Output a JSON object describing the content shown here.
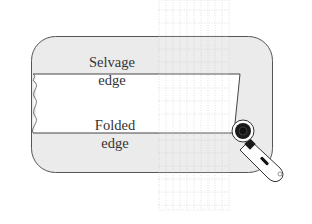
{
  "diagram": {
    "labels": {
      "selvage_line1": "Selvage",
      "selvage_line2": "edge",
      "folded_line1": "Folded",
      "folded_line2": "edge"
    },
    "elements": {
      "cutting_mat": "cutting-mat",
      "fabric": "folded-fabric",
      "ruler": "quilting-ruler",
      "tool": "rotary-cutter"
    },
    "colors": {
      "mat_fill": "#ebebeb",
      "mat_stroke": "#555555",
      "fabric_fill": "#ffffff",
      "ruler_grid": "#b0b0b0",
      "cutter_dark": "#1a1a1a",
      "text": "#333333"
    }
  }
}
